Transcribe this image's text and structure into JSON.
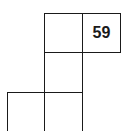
{
  "grid": {
    "cells": [
      {
        "row": 0,
        "col": 1,
        "value": ""
      },
      {
        "row": 0,
        "col": 2,
        "value": "59"
      },
      {
        "row": 1,
        "col": 1,
        "value": ""
      },
      {
        "row": 2,
        "col": 0,
        "value": ""
      },
      {
        "row": 2,
        "col": 1,
        "value": ""
      }
    ]
  }
}
